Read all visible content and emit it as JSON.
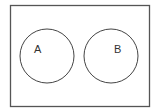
{
  "diagram": {
    "type": "venn",
    "universal_set": {
      "x": 10,
      "y": 5,
      "width": 139,
      "height": 101,
      "stroke": "#555555"
    },
    "sets": [
      {
        "label": "A",
        "cx": 47,
        "cy": 56,
        "r": 27,
        "label_x": 38,
        "label_y": 53
      },
      {
        "label": "B",
        "cx": 111,
        "cy": 56,
        "r": 27,
        "label_x": 117,
        "label_y": 53
      }
    ],
    "stroke_color": "#444444",
    "intersection": "none"
  }
}
